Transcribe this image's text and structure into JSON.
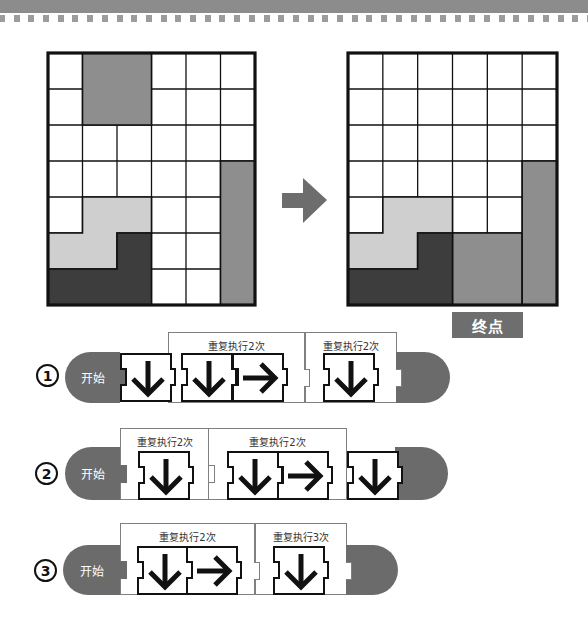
{
  "header": {
    "band_color": "#8c8c8c",
    "dots_color": "#9c9c9c"
  },
  "colors": {
    "piece_medium": "#8e8e8e",
    "piece_light": "#cfcfcf",
    "piece_dark": "#3d3d3d",
    "program_gray": "#6b6b6b",
    "goal_label_bg": "#6e6e6e"
  },
  "boards": [
    {
      "id": "start",
      "rows": 7,
      "cols": 6,
      "pieces": [
        {
          "name": "square-2x2",
          "color": "#8e8e8e",
          "points": [
            [
              1,
              0
            ],
            [
              3,
              0
            ],
            [
              3,
              2
            ],
            [
              1,
              2
            ]
          ]
        },
        {
          "name": "bar-1x4",
          "color": "#8e8e8e",
          "points": [
            [
              5,
              3
            ],
            [
              6,
              3
            ],
            [
              6,
              7
            ],
            [
              5,
              7
            ]
          ]
        },
        {
          "name": "l-piece-light",
          "color": "#cfcfcf",
          "points": [
            [
              1,
              4
            ],
            [
              3,
              4
            ],
            [
              3,
              5
            ],
            [
              2,
              5
            ],
            [
              2,
              6
            ],
            [
              0,
              6
            ],
            [
              0,
              5
            ],
            [
              1,
              5
            ]
          ]
        },
        {
          "name": "l-piece-dark",
          "color": "#3d3d3d",
          "points": [
            [
              2,
              5
            ],
            [
              3,
              5
            ],
            [
              3,
              7
            ],
            [
              0,
              7
            ],
            [
              0,
              6
            ],
            [
              2,
              6
            ]
          ]
        }
      ]
    },
    {
      "id": "goal",
      "rows": 7,
      "cols": 6,
      "pieces": [
        {
          "name": "square-2x2",
          "color": "#8e8e8e",
          "points": [
            [
              3,
              5
            ],
            [
              5,
              5
            ],
            [
              5,
              7
            ],
            [
              3,
              7
            ]
          ]
        },
        {
          "name": "bar-1x4",
          "color": "#8e8e8e",
          "points": [
            [
              5,
              3
            ],
            [
              6,
              3
            ],
            [
              6,
              7
            ],
            [
              5,
              7
            ]
          ]
        },
        {
          "name": "l-piece-light",
          "color": "#cfcfcf",
          "points": [
            [
              1,
              4
            ],
            [
              3,
              4
            ],
            [
              3,
              5
            ],
            [
              2,
              5
            ],
            [
              2,
              6
            ],
            [
              0,
              6
            ],
            [
              0,
              5
            ],
            [
              1,
              5
            ]
          ]
        },
        {
          "name": "l-piece-dark",
          "color": "#3d3d3d",
          "points": [
            [
              2,
              5
            ],
            [
              3,
              5
            ],
            [
              3,
              7
            ],
            [
              0,
              7
            ],
            [
              0,
              6
            ],
            [
              2,
              6
            ]
          ]
        }
      ]
    }
  ],
  "transition_arrow": {
    "icon": "arrow-right-icon",
    "color": "#6d6d6d"
  },
  "goal_label": "终点",
  "options": [
    {
      "marker": "1",
      "start_label": "开始",
      "sequence": [
        {
          "type": "block",
          "dir": "down"
        },
        {
          "type": "repeat",
          "label": "重复执行2次",
          "times": 2,
          "blocks": [
            "down",
            "right"
          ]
        },
        {
          "type": "repeat",
          "label": "重复执行2次",
          "times": 2,
          "blocks": [
            "down"
          ]
        }
      ]
    },
    {
      "marker": "2",
      "start_label": "开始",
      "sequence": [
        {
          "type": "repeat",
          "label": "重复执行2次",
          "times": 2,
          "blocks": [
            "down"
          ]
        },
        {
          "type": "repeat",
          "label": "重复执行2次",
          "times": 2,
          "blocks": [
            "down",
            "right"
          ]
        },
        {
          "type": "block",
          "dir": "down"
        }
      ]
    },
    {
      "marker": "3",
      "start_label": "开始",
      "sequence": [
        {
          "type": "repeat",
          "label": "重复执行2次",
          "times": 2,
          "blocks": [
            "down",
            "right"
          ]
        },
        {
          "type": "repeat",
          "label": "重复执行3次",
          "times": 3,
          "blocks": [
            "down"
          ]
        }
      ]
    }
  ]
}
